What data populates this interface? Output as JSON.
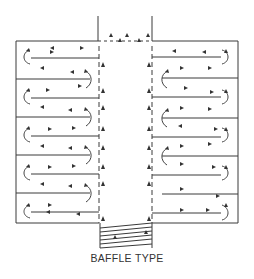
{
  "diagram": {
    "title": "BAFFLE TYPE",
    "colors": {
      "line": "#3a3a3a",
      "background": "#ffffff"
    },
    "components": [
      "outer-casing",
      "central-flue",
      "left-baffle-stack",
      "right-baffle-stack",
      "inlet-baffle-box",
      "flow-arrows"
    ]
  }
}
